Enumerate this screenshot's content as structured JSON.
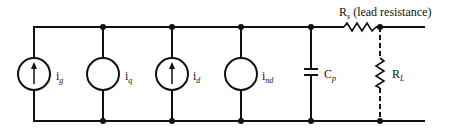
{
  "diagram": {
    "type": "circuit-schematic",
    "wire_color": "#111111",
    "components": [
      {
        "id": "ig",
        "kind": "current-source",
        "arrow": true,
        "label_main": "i",
        "label_sub": "g"
      },
      {
        "id": "iq",
        "kind": "current-source",
        "arrow": false,
        "label_main": "i",
        "label_sub": "q"
      },
      {
        "id": "id",
        "kind": "current-source",
        "arrow": true,
        "label_main": "i",
        "label_sub": "d"
      },
      {
        "id": "ind",
        "kind": "current-source",
        "arrow": false,
        "label_main": "i",
        "label_sub": "nd"
      },
      {
        "id": "cp",
        "kind": "capacitor",
        "label_main": "C",
        "label_sub": "p"
      },
      {
        "id": "rs",
        "kind": "resistor",
        "label_main": "R",
        "label_sub": "s",
        "label_note": " (lead resistance)"
      },
      {
        "id": "rl",
        "kind": "resistor",
        "connection": "dashed",
        "label_main": "R",
        "label_sub": "L"
      }
    ]
  }
}
